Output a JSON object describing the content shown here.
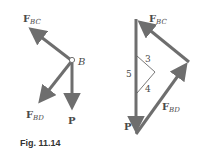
{
  "figure": {
    "caption": "Fig. 11.14",
    "free_body": {
      "point_label": "B",
      "forces": [
        {
          "id": "F_BC",
          "label_main": "F",
          "label_sub": "BC"
        },
        {
          "id": "F_BD",
          "label_main": "F",
          "label_sub": "BD"
        },
        {
          "id": "P",
          "label_main": "P",
          "label_sub": ""
        }
      ]
    },
    "force_triangle": {
      "labels": {
        "F_BC": {
          "main": "F",
          "sub": "BC"
        },
        "F_BD": {
          "main": "F",
          "sub": "BD"
        },
        "P": {
          "main": "P"
        }
      },
      "slope_triangle": {
        "side_vertical": "5",
        "side_top": "3",
        "side_bottom": "4"
      }
    },
    "colors": {
      "arrow": "#6e6e6e",
      "text": "#4a4a4a",
      "thin_line": "#555555"
    }
  }
}
